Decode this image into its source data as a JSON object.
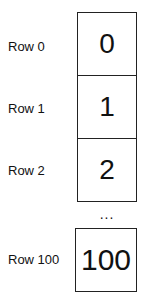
{
  "rows": [
    {
      "label": "Row 0",
      "value": "0"
    },
    {
      "label": "Row 1",
      "value": "1"
    },
    {
      "label": "Row 2",
      "value": "2"
    },
    {
      "label": "Row 100",
      "value": "100"
    }
  ],
  "ellipsis": "..."
}
